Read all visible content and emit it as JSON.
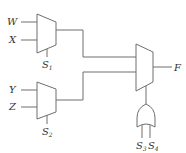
{
  "diagram": {
    "type": "logic-circuit",
    "components": [
      {
        "id": "mux1",
        "kind": "multiplexer",
        "inputs": [
          "W",
          "X"
        ],
        "select": "S1"
      },
      {
        "id": "mux2",
        "kind": "multiplexer",
        "inputs": [
          "Y",
          "Z"
        ],
        "select": "S2"
      },
      {
        "id": "mux3",
        "kind": "multiplexer",
        "inputs": [
          "mux1",
          "mux2"
        ],
        "select": "or1",
        "output": "F"
      },
      {
        "id": "or1",
        "kind": "or-gate",
        "inputs": [
          "S3",
          "S4"
        ]
      }
    ]
  },
  "labels": {
    "w": "W",
    "x": "X",
    "y": "Y",
    "z": "Z",
    "s1": {
      "base": "S",
      "sub": "1"
    },
    "s2": {
      "base": "S",
      "sub": "2"
    },
    "s3": {
      "base": "S",
      "sub": "3"
    },
    "s4": {
      "base": "S",
      "sub": "4"
    },
    "f": "F"
  },
  "colors": {
    "line": "#6e6e6e",
    "text": "#333333",
    "background": "#ffffff"
  }
}
